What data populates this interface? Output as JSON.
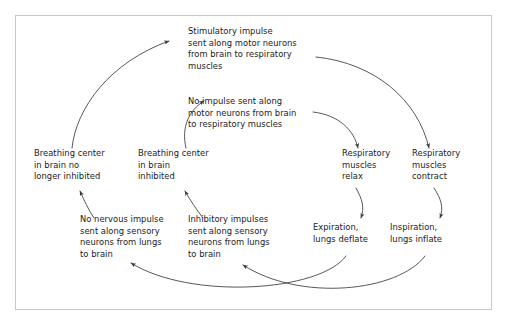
{
  "diagram": {
    "background_color": "#ffffff",
    "border_color": "#c8c8c8",
    "text_color": "#1a1a1a",
    "arrow_color": "#3a3a3a",
    "nodes": [
      {
        "id": "stimulatory-impulse",
        "text": "Stimulatory impulse\nsent along motor neurons\nfrom brain to respiratory\nmuscles"
      },
      {
        "id": "no-impulse",
        "text": "No impulse sent along\nmotor neurons from brain\nto respiratory muscles"
      },
      {
        "id": "breathing-center-not-inhibited",
        "text": "Breathing center\nin brain no\nlonger inhibited"
      },
      {
        "id": "breathing-center-inhibited",
        "text": "Breathing center\nin brain\ninhibited"
      },
      {
        "id": "muscles-relax",
        "text": "Respiratory\nmuscles\nrelax"
      },
      {
        "id": "muscles-contract",
        "text": "Respiratory\nmuscles\ncontract"
      },
      {
        "id": "no-nervous-impulse",
        "text": "No nervous impulse\nsent along sensory\nneurons from lungs\nto brain"
      },
      {
        "id": "inhibitory-impulses",
        "text": "Inhibitory impulses\nsent along sensory\nneurons from lungs\nto brain"
      },
      {
        "id": "expiration",
        "text": "Expiration,\nlungs deflate"
      },
      {
        "id": "inspiration",
        "text": "Inspiration,\nlungs inflate"
      }
    ],
    "connections": [
      {
        "id": "arrow-not-inhibited-to-stimulatory",
        "from": "breathing-center-not-inhibited",
        "to": "stimulatory-impulse"
      },
      {
        "id": "arrow-stimulatory-to-contract",
        "from": "stimulatory-impulse",
        "to": "muscles-contract"
      },
      {
        "id": "arrow-contract-to-inspiration",
        "from": "muscles-contract",
        "to": "inspiration"
      },
      {
        "id": "arrow-inspiration-to-inhibitory",
        "from": "inspiration",
        "to": "inhibitory-impulses"
      },
      {
        "id": "arrow-inhibitory-to-inhibited",
        "from": "inhibitory-impulses",
        "to": "breathing-center-inhibited"
      },
      {
        "id": "arrow-inhibited-to-no-impulse",
        "from": "breathing-center-inhibited",
        "to": "no-impulse"
      },
      {
        "id": "arrow-no-impulse-to-relax",
        "from": "no-impulse",
        "to": "muscles-relax"
      },
      {
        "id": "arrow-relax-to-expiration",
        "from": "muscles-relax",
        "to": "expiration"
      },
      {
        "id": "arrow-expiration-to-no-nervous",
        "from": "expiration",
        "to": "no-nervous-impulse"
      },
      {
        "id": "arrow-no-nervous-to-not-inhibited",
        "from": "no-nervous-impulse",
        "to": "breathing-center-not-inhibited"
      }
    ]
  }
}
